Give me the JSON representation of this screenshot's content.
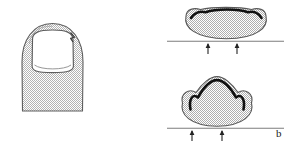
{
  "figure": {
    "label": "b",
    "label_position": {
      "x": 276,
      "y": 128
    },
    "colors": {
      "tissue_fill": "#c9c9c9",
      "tissue_outline": "#595959",
      "nail_plate_fill": "#ffffff",
      "nail_plate_outline": "#5a5a5a",
      "nail_edge_dark": "#111111",
      "baseline": "#7a7a7a",
      "arrow": "#222222",
      "background": "#ffffff"
    },
    "panels": [
      {
        "name": "dorsal-fingertip-view",
        "description": "Dorsal view of a distal fingertip showing the nail plate, lateral nail folds and proximal nail fold with lunula",
        "parts": [
          {
            "name": "finger-pulp-outline",
            "shading": "stippled-gray"
          },
          {
            "name": "nail-plate",
            "shading": "white"
          },
          {
            "name": "lunula-line",
            "shading": "thin-curve"
          },
          {
            "name": "lateral-nail-fold-notch",
            "shading": "hook-detail"
          }
        ]
      },
      {
        "name": "cross-section-normal-nail",
        "position": "top-right",
        "description": "Transverse cross-section of a broad, gently curved nail resting on the distal phalanx with upward ground-reaction forces",
        "nail_curvature": "flat / gently convex",
        "arrows": {
          "count": 2,
          "direction": "up",
          "x_positions": [
            208,
            237
          ]
        },
        "baseline": {
          "y": 41,
          "x_start": 167,
          "x_end": 284
        }
      },
      {
        "name": "cross-section-pincer-nail",
        "position": "bottom-right",
        "description": "Transverse cross-section of an over-curved pincer (trumpet) nail with a sharp peak and in-rolled lateral edges, with upward ground-reaction forces",
        "nail_curvature": "sharply peaked / over-curved",
        "arrows": {
          "count": 2,
          "direction": "up",
          "x_positions": [
            192,
            222
          ]
        },
        "baseline": {
          "y": 128,
          "x_start": 167,
          "x_end": 284
        }
      }
    ]
  }
}
